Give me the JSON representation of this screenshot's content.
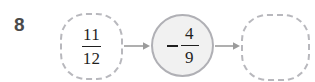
{
  "problem": {
    "number": "8",
    "input": {
      "sign": "",
      "numerator": "11",
      "denominator": "12",
      "text": "11/12"
    },
    "operator": {
      "sign": "−",
      "numerator": "4",
      "denominator": "9",
      "text": "-4/9"
    },
    "answer": {
      "value": "",
      "placeholder": ""
    },
    "arrows": {
      "first": "arrow-right",
      "second": "arrow-right"
    }
  },
  "colors": {
    "background": "#ffffff",
    "number_text": "#4a4a4a",
    "fraction_text": "#1f1f1f",
    "dashed_border": "#b8b8bd",
    "solid_border": "#b0b0b5",
    "operator_fill": "#f1f1f1",
    "arrow": "#9b9b9b"
  }
}
